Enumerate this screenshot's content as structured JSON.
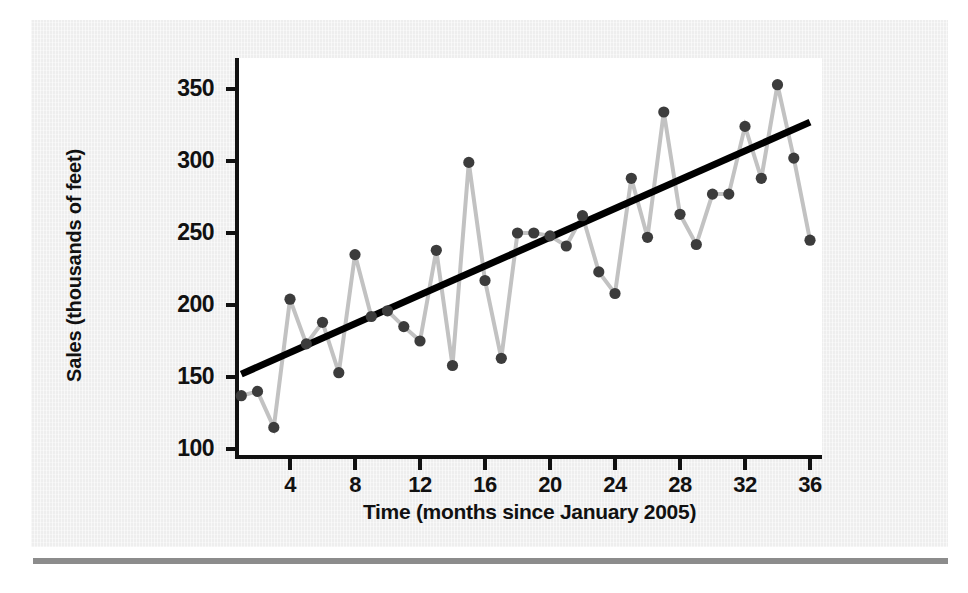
{
  "figure": {
    "background_color": "#eeeeee",
    "canvas_color": "#ffffff",
    "rule_color": "#8c8c8c"
  },
  "chart_data": {
    "type": "line",
    "title": "",
    "subtitle": "",
    "xlabel": "Time (months since January 2005)",
    "ylabel": "Sales (thousands of feet)",
    "xlim": [
      0,
      37
    ],
    "ylim": [
      90,
      362
    ],
    "xticks": [
      4,
      8,
      12,
      16,
      20,
      24,
      28,
      32,
      36
    ],
    "yticks": [
      100,
      150,
      200,
      250,
      300,
      350
    ],
    "xtick_labels": [
      "4",
      "8",
      "12",
      "16",
      "20",
      "24",
      "28",
      "32",
      "36"
    ],
    "ytick_labels": [
      "100",
      "150",
      "200",
      "250",
      "300",
      "350"
    ],
    "grid": false,
    "legend": "none",
    "marker_color": "#3c3c3c",
    "line_color": "#c2c2c2",
    "trend_color": "#000000",
    "x": [
      1,
      2,
      3,
      4,
      5,
      6,
      7,
      8,
      9,
      10,
      11,
      12,
      13,
      14,
      15,
      16,
      17,
      18,
      19,
      20,
      21,
      22,
      23,
      24,
      25,
      26,
      27,
      28,
      29,
      30,
      31,
      32,
      33,
      34,
      35,
      36
    ],
    "series": [
      {
        "name": "Sales",
        "type": "line",
        "values": [
          137,
          140,
          115,
          204,
          173,
          188,
          153,
          235,
          192,
          196,
          185,
          175,
          238,
          158,
          299,
          217,
          163,
          250,
          250,
          248,
          241,
          262,
          223,
          208,
          288,
          247,
          334,
          263,
          242,
          277,
          277,
          324,
          288,
          353,
          302,
          245
        ]
      },
      {
        "name": "Trend line",
        "type": "line",
        "endpoints": [
          {
            "x": 1,
            "y": 152
          },
          {
            "x": 36,
            "y": 327
          }
        ],
        "slope_per_month": 5.0,
        "intercept_at_month_1": 152
      }
    ]
  },
  "annotations": {
    "none": ""
  }
}
